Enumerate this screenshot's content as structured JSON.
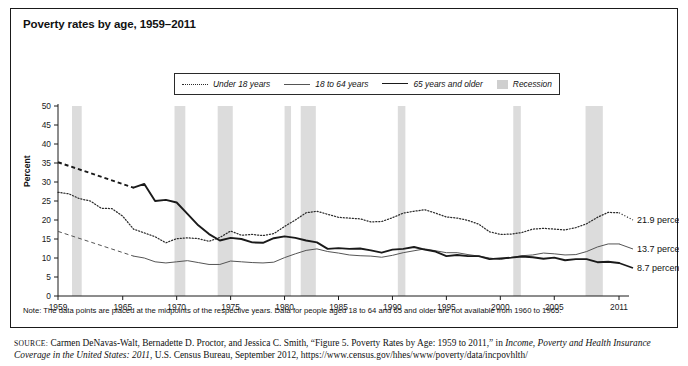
{
  "figure": {
    "title": "Poverty rates by age, 1959–2011",
    "note": "Note: The data points are placed at the midpoints of the respective years. Data for people aged 18 to 64 and 65 and older are not available from 1960 to 1965.",
    "source": {
      "keyword": "SOURCE:",
      "part1": " Carmen DeNavas-Walt, Bernadette D. Proctor, and Jessica C. Smith, “Figure 5. Poverty Rates by Age: 1959 to 2011,” in ",
      "italic1": "Income, Poverty and Health Insurance Coverage in the United States: 2011",
      "part2": ", U.S. Census Bureau, September 2012, https://www.census.gov/hhes/www/poverty/data/incpovhlth/"
    }
  },
  "legend": {
    "items": [
      {
        "label": "Under 18 years",
        "style": "dotted",
        "color": "#2b2b2b"
      },
      {
        "label": "18 to 64 years",
        "style": "thin-solid",
        "color": "#555555"
      },
      {
        "label": "65 years and older",
        "style": "thick-solid",
        "color": "#1a1a1a"
      },
      {
        "label": "Recession",
        "style": "shaded-box",
        "color": "#cfcfcf"
      }
    ]
  },
  "end_labels": [
    {
      "text": "21.9 percent",
      "series": "Under 18 years"
    },
    {
      "text": "13.7 percent",
      "series": "18 to 64 years"
    },
    {
      "text": "8.7 percent",
      "series": "65 years and older"
    }
  ],
  "chart_data": {
    "type": "line",
    "title": "Poverty rates by age, 1959–2011",
    "xlabel": "",
    "ylabel": "Percent",
    "xlim": [
      1959,
      2011
    ],
    "ylim": [
      0,
      50
    ],
    "ytick_step": 5,
    "yticks": [
      0,
      5,
      10,
      15,
      20,
      25,
      30,
      35,
      40,
      45,
      50
    ],
    "xticks": [
      1959,
      1965,
      1970,
      1975,
      1980,
      1985,
      1990,
      1995,
      2000,
      2005,
      2011
    ],
    "grid": false,
    "legend_position": "top-center",
    "series": [
      {
        "name": "Under 18 years",
        "style": "dotted",
        "color": "#2b2b2b",
        "x": [
          1959,
          1960,
          1961,
          1962,
          1963,
          1964,
          1965,
          1966,
          1967,
          1968,
          1969,
          1970,
          1971,
          1972,
          1973,
          1974,
          1975,
          1976,
          1977,
          1978,
          1979,
          1980,
          1981,
          1982,
          1983,
          1984,
          1985,
          1986,
          1987,
          1988,
          1989,
          1990,
          1991,
          1992,
          1993,
          1994,
          1995,
          1996,
          1997,
          1998,
          1999,
          2000,
          2001,
          2002,
          2003,
          2004,
          2005,
          2006,
          2007,
          2008,
          2009,
          2010,
          2011
        ],
        "y": [
          27.3,
          26.9,
          25.6,
          25.0,
          23.1,
          23.0,
          21.0,
          17.6,
          16.6,
          15.6,
          14.0,
          15.1,
          15.3,
          15.1,
          14.4,
          15.4,
          17.1,
          16.0,
          16.2,
          15.9,
          16.4,
          18.3,
          20.0,
          21.9,
          22.3,
          21.5,
          20.7,
          20.5,
          20.3,
          19.5,
          19.6,
          20.6,
          21.8,
          22.3,
          22.7,
          21.8,
          20.8,
          20.5,
          19.9,
          18.9,
          16.9,
          16.2,
          16.3,
          16.7,
          17.6,
          17.8,
          17.6,
          17.4,
          18.0,
          19.0,
          20.7,
          22.0,
          21.9
        ]
      },
      {
        "name": "18 to 64 years",
        "style": "thin-solid",
        "color": "#555555",
        "x": [
          1959,
          1966,
          1967,
          1968,
          1969,
          1970,
          1971,
          1972,
          1973,
          1974,
          1975,
          1976,
          1977,
          1978,
          1979,
          1980,
          1981,
          1982,
          1983,
          1984,
          1985,
          1986,
          1987,
          1988,
          1989,
          1990,
          1991,
          1992,
          1993,
          1994,
          1995,
          1996,
          1997,
          1998,
          1999,
          2000,
          2001,
          2002,
          2003,
          2004,
          2005,
          2006,
          2007,
          2008,
          2009,
          2010,
          2011
        ],
        "y": [
          17.0,
          10.5,
          10.0,
          9.0,
          8.7,
          9.0,
          9.3,
          8.8,
          8.3,
          8.3,
          9.2,
          9.0,
          8.8,
          8.7,
          8.9,
          10.1,
          11.1,
          12.0,
          12.4,
          11.7,
          11.3,
          10.8,
          10.6,
          10.5,
          10.2,
          10.7,
          11.4,
          11.9,
          12.4,
          11.9,
          11.4,
          11.4,
          10.9,
          10.5,
          10.0,
          9.6,
          10.1,
          10.6,
          10.8,
          11.3,
          11.1,
          10.8,
          10.9,
          11.7,
          12.9,
          13.7,
          13.7
        ]
      },
      {
        "name": "65 years and older",
        "style": "thick-solid",
        "color": "#1a1a1a",
        "x": [
          1959,
          1966,
          1967,
          1968,
          1969,
          1970,
          1971,
          1972,
          1973,
          1974,
          1975,
          1976,
          1977,
          1978,
          1979,
          1980,
          1981,
          1982,
          1983,
          1984,
          1985,
          1986,
          1987,
          1988,
          1989,
          1990,
          1991,
          1992,
          1993,
          1994,
          1995,
          1996,
          1997,
          1998,
          1999,
          2000,
          2001,
          2002,
          2003,
          2004,
          2005,
          2006,
          2007,
          2008,
          2009,
          2010,
          2011
        ],
        "y": [
          35.2,
          28.5,
          29.5,
          25.0,
          25.3,
          24.6,
          21.6,
          18.6,
          16.3,
          14.6,
          15.3,
          15.0,
          14.1,
          14.0,
          15.2,
          15.7,
          15.3,
          14.6,
          14.1,
          12.4,
          12.6,
          12.4,
          12.5,
          12.0,
          11.4,
          12.2,
          12.4,
          12.9,
          12.2,
          11.7,
          10.5,
          10.8,
          10.5,
          10.5,
          9.7,
          9.9,
          10.1,
          10.4,
          10.2,
          9.8,
          10.1,
          9.4,
          9.7,
          9.7,
          8.9,
          9.0,
          8.7
        ]
      }
    ],
    "recession_bands": [
      {
        "start": 1960.3,
        "end": 1961.2
      },
      {
        "start": 1969.8,
        "end": 1970.8
      },
      {
        "start": 1973.8,
        "end": 1975.2
      },
      {
        "start": 1980.0,
        "end": 1980.6
      },
      {
        "start": 1981.5,
        "end": 1982.9
      },
      {
        "start": 1990.5,
        "end": 1991.2
      },
      {
        "start": 2001.2,
        "end": 2001.9
      },
      {
        "start": 2007.9,
        "end": 2009.5
      }
    ],
    "dashed_gap": {
      "note": "18 to 64 and 65 and older are interpolated (dashed) between 1959 and 1966",
      "from": 1959,
      "to": 1966
    }
  }
}
